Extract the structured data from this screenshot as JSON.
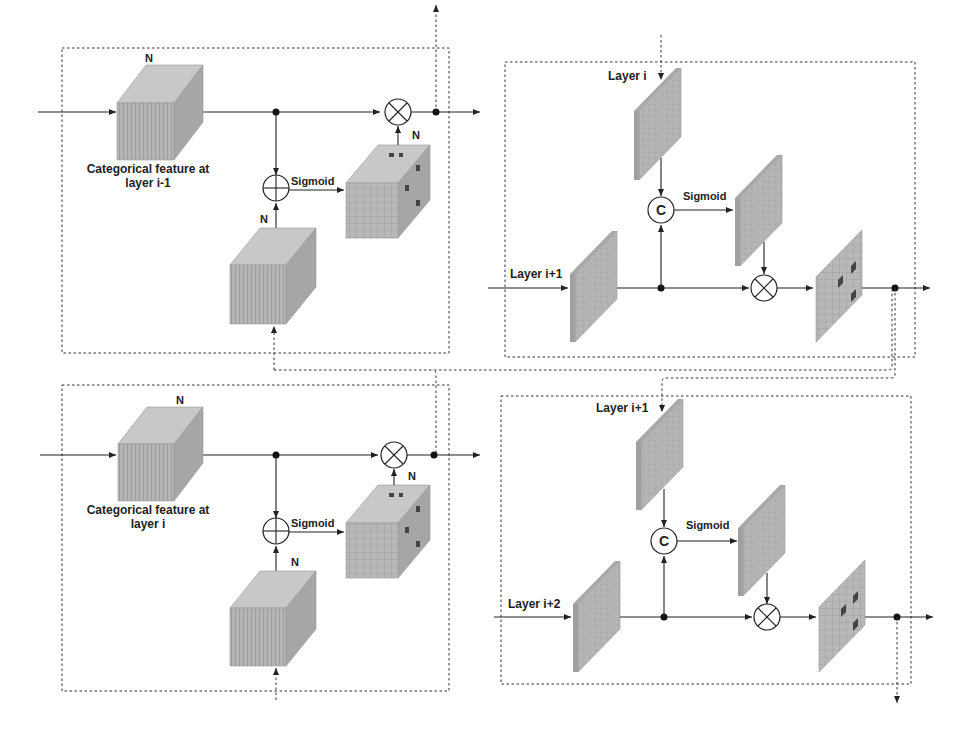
{
  "diagram": {
    "left_top": {
      "input_label": "Categorical feature at",
      "input_label_line2": "layer i-1",
      "channel_label_input": "N",
      "channel_label_branch": "N",
      "channel_label_attention": "N",
      "activation": "Sigmoid",
      "merge_op": "add",
      "gate_op": "multiply"
    },
    "left_bottom": {
      "input_label": "Categorical feature at",
      "input_label_line2": "layer i",
      "channel_label_input": "N",
      "channel_label_branch": "N",
      "channel_label_attention": "N",
      "activation": "Sigmoid",
      "merge_op": "add",
      "gate_op": "multiply"
    },
    "right_top": {
      "top_input_label": "Layer i",
      "main_input_label": "Layer i+1",
      "concat_symbol": "C",
      "activation": "Sigmoid",
      "gate_op": "multiply"
    },
    "right_bottom": {
      "top_input_label": "Layer i+1",
      "main_input_label": "Layer i+2",
      "concat_symbol": "C",
      "activation": "Sigmoid",
      "gate_op": "multiply"
    },
    "colors": {
      "feature_fill": "#b5b5b5",
      "highlight_cell": "#444444",
      "line": "#222222"
    }
  }
}
